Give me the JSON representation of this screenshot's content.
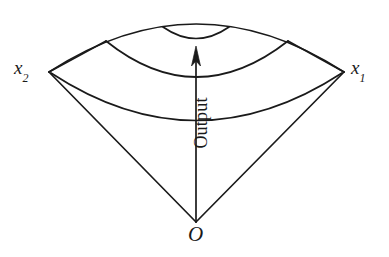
{
  "figure": {
    "type": "diagram",
    "background_color": "#ffffff",
    "stroke_color": "#1a1a1a",
    "labels": {
      "left_axis": "x",
      "left_axis_sub": "2",
      "right_axis": "x",
      "right_axis_sub": "1",
      "origin": "O",
      "arrow": "Output"
    },
    "geometry": {
      "origin_point": [
        196,
        222
      ],
      "left_vertex": [
        49,
        72
      ],
      "right_vertex": [
        344,
        72
      ],
      "arrow_tip": [
        196,
        48
      ],
      "outer_arc_peak_y": 26,
      "middle_arc_peak_y": 55,
      "inner_arc_peak_y": 110,
      "small_arc_span_x": [
        163,
        229
      ],
      "small_arc_peak_y": 38,
      "arc_count": 4
    }
  }
}
